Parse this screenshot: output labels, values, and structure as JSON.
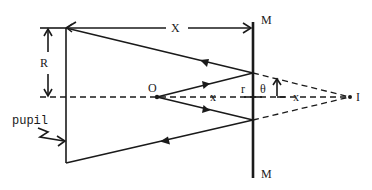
{
  "diagram": {
    "type": "optics ray diagram (plane mirror reflection, pupil, virtual image)",
    "labels": {
      "distance_pupil_to_mirror": "X",
      "pupil_radius": "R",
      "mirror_top": "M",
      "mirror_bottom": "M",
      "object_point": "O",
      "image_point": "I",
      "object_distance": "x",
      "image_distance": "x",
      "mirror_half_aperture": "r",
      "angle": "θ",
      "pupil": "pupil"
    },
    "elements": [
      {
        "id": "pupil",
        "kind": "vertical line",
        "description": "Pupil plane at left"
      },
      {
        "id": "mirror",
        "kind": "thick vertical line",
        "description": "Plane mirror M–M"
      },
      {
        "id": "axis",
        "kind": "dashed horizontal line",
        "description": "Optical axis through O and I"
      },
      {
        "id": "rays_incident",
        "kind": "solid lines with arrows",
        "description": "Rays from O to mirror"
      },
      {
        "id": "rays_reflected",
        "kind": "solid lines with arrows",
        "description": "Reflected rays from mirror to pupil edges"
      },
      {
        "id": "rays_virtual",
        "kind": "dashed lines",
        "description": "Virtual extensions converging at image I"
      }
    ]
  }
}
